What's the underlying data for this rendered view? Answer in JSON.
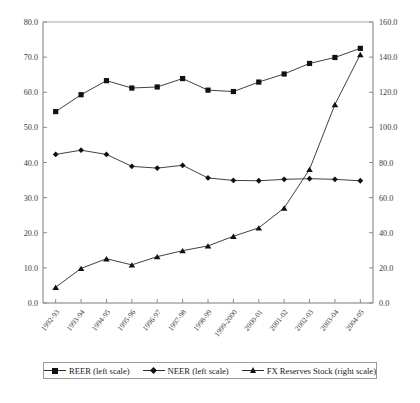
{
  "chart_data": {
    "type": "line",
    "title": "",
    "subtitle": "",
    "xlabel": "",
    "ylabel": "",
    "ylabel_right": "",
    "grid": false,
    "legend_position": "bottom",
    "categories": [
      "1992-93",
      "1993-94",
      "1994-95",
      "1995-96",
      "1996-97",
      "1997-98",
      "1998-99",
      "1999-2000",
      "2000-01",
      "2001-02",
      "2002-03",
      "2003-04",
      "2004-05"
    ],
    "left_axis": {
      "min": 0.0,
      "max": 80.0,
      "step": 10.0,
      "ticks": [
        "0.0",
        "10.0",
        "20.0",
        "30.0",
        "40.0",
        "50.0",
        "60.0",
        "70.0",
        "80.0"
      ]
    },
    "right_axis": {
      "min": 0.0,
      "max": 160.0,
      "step": 20.0,
      "ticks": [
        "0.0",
        "20.0",
        "40.0",
        "60.0",
        "80.0",
        "100.0",
        "120.0",
        "140.0",
        "160.0"
      ]
    },
    "series": [
      {
        "name": "REER (left scale)",
        "axis": "left",
        "marker": "square",
        "values": [
          54.5,
          59.3,
          63.3,
          61.2,
          61.5,
          63.9,
          60.6,
          60.2,
          62.9,
          65.2,
          68.2,
          69.9,
          72.5
        ]
      },
      {
        "name": "NEER (left scale)",
        "axis": "left",
        "marker": "diamond",
        "values": [
          42.3,
          43.5,
          42.3,
          38.9,
          38.4,
          39.2,
          35.6,
          34.9,
          34.8,
          35.2,
          35.4,
          35.2,
          34.8
        ]
      },
      {
        "name": "FX Reserves Stock (right scale)",
        "axis": "right",
        "marker": "triangle",
        "values": [
          9.0,
          19.7,
          25.2,
          21.7,
          26.4,
          29.8,
          32.5,
          38.0,
          42.8,
          54.1,
          76.1,
          113.0,
          141.5
        ]
      }
    ]
  },
  "legend": {
    "items": [
      {
        "label": "REER (left scale)",
        "marker": "square"
      },
      {
        "label": "NEER (left scale)",
        "marker": "diamond"
      },
      {
        "label": "FX Reserves Stock (right scale)",
        "marker": "triangle"
      }
    ]
  }
}
